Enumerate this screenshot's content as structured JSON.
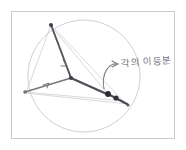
{
  "figure": {
    "kind": "hand-drawn-geometry-sketch",
    "title_text": "",
    "background_color": "#ffffff",
    "frame": {
      "name": "sketch-frame",
      "color": "#c9c9cf",
      "x": 11,
      "y": 11,
      "width": 164,
      "height": 128
    },
    "circle": {
      "name": "circumscribed-circle",
      "color": "#c6c6cc",
      "cx": 84,
      "cy": 76,
      "r": 56
    },
    "points": [
      {
        "id": "A",
        "role": "top-vertex",
        "x": 51,
        "y": 25,
        "color": "#4a4a50",
        "size": 2.4
      },
      {
        "id": "B",
        "role": "left-vertex",
        "x": 25,
        "y": 92,
        "color": "#6e6e76",
        "size": 2.0
      },
      {
        "id": "C",
        "role": "right-vertex",
        "x": 123,
        "y": 101,
        "color": "#3b3b41",
        "size": 2.6
      },
      {
        "id": "I",
        "role": "incenter-point",
        "x": 71,
        "y": 78,
        "color": "#44444a",
        "size": 2.4
      },
      {
        "id": "M",
        "role": "arc-midpoint",
        "x": 108,
        "y": 94,
        "color": "#2e2e33",
        "size": 3.0
      }
    ],
    "thin_lines": [
      {
        "name": "chord-top-to-left",
        "from": "A",
        "to": "B"
      },
      {
        "name": "chord-top-to-right",
        "from": "A",
        "to": "C"
      },
      {
        "name": "chord-left-to-right",
        "from": "B",
        "to": "C"
      },
      {
        "name": "chord-left-to-lower-right",
        "from": "B",
        "to": "Cext"
      }
    ],
    "bold_lines": [
      {
        "name": "bisector-top-to-incenter",
        "from": "A",
        "to": "I"
      },
      {
        "name": "bisector-incenter-to-arc",
        "from": "I",
        "to": "M"
      },
      {
        "name": "segment-left-to-incenter",
        "from": "B",
        "to": "I"
      },
      {
        "name": "segment-arc-to-right",
        "from": "M",
        "to": "C"
      }
    ],
    "annotation": {
      "name": "angle-bisector-annotation",
      "text": "각의 이등분",
      "text_color": "#6b6b72",
      "x": 119,
      "y": 61,
      "arrow": {
        "name": "curved-callout-arrow",
        "color": "#7a7a82",
        "start_x": 107,
        "start_y": 88,
        "ctrl_x": 122,
        "ctrl_y": 62,
        "end_x": 116,
        "end_y": 67
      }
    }
  }
}
